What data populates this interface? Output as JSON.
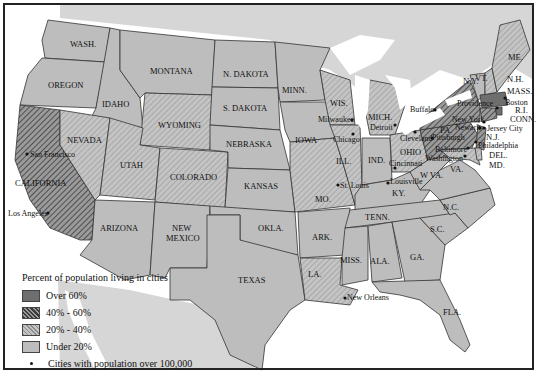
{
  "map": {
    "type": "choropleth",
    "subject": "Percent of population living in cities, United States",
    "colors": {
      "over_60": "#6e6e6e",
      "40_60": "#8a8a8a",
      "20_40": "#c0c0c0",
      "under_20": "#bdbdbd",
      "water": "#ffffff",
      "foreign": "#d9d9d9",
      "border": "#333333"
    }
  },
  "legend": {
    "title": "Percent of population living in cities",
    "items": [
      {
        "label": "Over 60%",
        "class": "over_60"
      },
      {
        "label": "40% - 60%",
        "class": "40_60"
      },
      {
        "label": "20% - 40%",
        "class": "20_40"
      },
      {
        "label": "Under 20%",
        "class": "under_20"
      }
    ],
    "city_marker_label": "Cities with population over 100,000"
  },
  "states": {
    "wash": {
      "label": "WASH.",
      "class": "under_20"
    },
    "oregon": {
      "label": "OREGON",
      "class": "under_20"
    },
    "california": {
      "label": "CALIFORNIA",
      "class": "40_60"
    },
    "idaho": {
      "label": "IDAHO",
      "class": "under_20"
    },
    "nevada": {
      "label": "NEVADA",
      "class": "20_40"
    },
    "montana": {
      "label": "MONTANA",
      "class": "under_20"
    },
    "wyoming": {
      "label": "WYOMING",
      "class": "20_40"
    },
    "utah": {
      "label": "UTAH",
      "class": "20_40"
    },
    "colorado": {
      "label": "COLORADO",
      "class": "20_40"
    },
    "arizona": {
      "label": "ARIZONA",
      "class": "under_20"
    },
    "new_mexico_1": {
      "label": "NEW",
      "class": "under_20"
    },
    "new_mexico_2": {
      "label": "MEXICO",
      "class": "under_20"
    },
    "n_dakota": {
      "label": "N. DAKOTA",
      "class": "under_20"
    },
    "s_dakota": {
      "label": "S. DAKOTA",
      "class": "under_20"
    },
    "nebraska": {
      "label": "NEBRASKA",
      "class": "under_20"
    },
    "kansas": {
      "label": "KANSAS",
      "class": "under_20"
    },
    "okla": {
      "label": "OKLA.",
      "class": "under_20"
    },
    "texas": {
      "label": "TEXAS",
      "class": "under_20"
    },
    "minn": {
      "label": "MINN.",
      "class": "under_20"
    },
    "iowa": {
      "label": "IOWA",
      "class": "under_20"
    },
    "mo": {
      "label": "MO.",
      "class": "20_40"
    },
    "ark": {
      "label": "ARK.",
      "class": "under_20"
    },
    "la": {
      "label": "LA.",
      "class": "20_40"
    },
    "wis": {
      "label": "WIS.",
      "class": "20_40"
    },
    "ill": {
      "label": "ILL.",
      "class": "20_40"
    },
    "mich": {
      "label": "MICH.",
      "class": "20_40"
    },
    "ind": {
      "label": "IND.",
      "class": "under_20"
    },
    "ohio": {
      "label": "OHIO",
      "class": "20_40"
    },
    "ky": {
      "label": "KY.",
      "class": "under_20"
    },
    "tenn": {
      "label": "TENN.",
      "class": "under_20"
    },
    "miss": {
      "label": "MISS.",
      "class": "under_20"
    },
    "ala": {
      "label": "ALA.",
      "class": "under_20"
    },
    "ga": {
      "label": "GA.",
      "class": "under_20"
    },
    "fla": {
      "label": "FLA.",
      "class": "under_20"
    },
    "sc": {
      "label": "S.C.",
      "class": "under_20"
    },
    "nc": {
      "label": "N.C.",
      "class": "under_20"
    },
    "va": {
      "label": "VA.",
      "class": "under_20"
    },
    "wva": {
      "label": "W VA.",
      "class": "under_20"
    },
    "pa": {
      "label": "PA.",
      "class": "40_60"
    },
    "ny": {
      "label": "N.Y.",
      "class": "40_60"
    },
    "vt": {
      "label": "VT.",
      "class": "under_20"
    },
    "me": {
      "label": "ME.",
      "class": "20_40"
    },
    "nh": {
      "label": "N.H.",
      "class": "20_40"
    },
    "mass": {
      "label": "MASS.",
      "class": "over_60"
    },
    "ri": {
      "label": "R.I.",
      "class": "over_60"
    },
    "conn": {
      "label": "CONN.",
      "class": "40_60"
    },
    "nj": {
      "label": "N.J.",
      "class": "40_60"
    },
    "del": {
      "label": "DEL.",
      "class": "20_40"
    },
    "md": {
      "label": "MD.",
      "class": "20_40"
    }
  },
  "cities": [
    {
      "name": "San Francisco"
    },
    {
      "name": "Los Angeles"
    },
    {
      "name": "Milwaukee"
    },
    {
      "name": "Chicago"
    },
    {
      "name": "Detroit"
    },
    {
      "name": "Cleveland"
    },
    {
      "name": "Buffalo"
    },
    {
      "name": "Cincinnati"
    },
    {
      "name": "St. Louis"
    },
    {
      "name": "Louisville"
    },
    {
      "name": "New Orleans"
    },
    {
      "name": "Providence"
    },
    {
      "name": "Boston"
    },
    {
      "name": "New York"
    },
    {
      "name": "Newark"
    },
    {
      "name": "Jersey City"
    },
    {
      "name": "Pittsburgh"
    },
    {
      "name": "Philadelphia"
    },
    {
      "name": "Baltimore"
    },
    {
      "name": "Washington"
    }
  ]
}
